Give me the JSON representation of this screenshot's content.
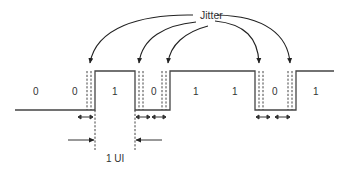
{
  "diagram": {
    "title_label": "Jitter",
    "bits": [
      "0",
      "0",
      "1",
      "0",
      "1",
      "1",
      "0",
      "1"
    ],
    "ui_label": "1 UI",
    "colors": {
      "line": "#444444",
      "text": "#333333",
      "background": "#ffffff"
    }
  }
}
